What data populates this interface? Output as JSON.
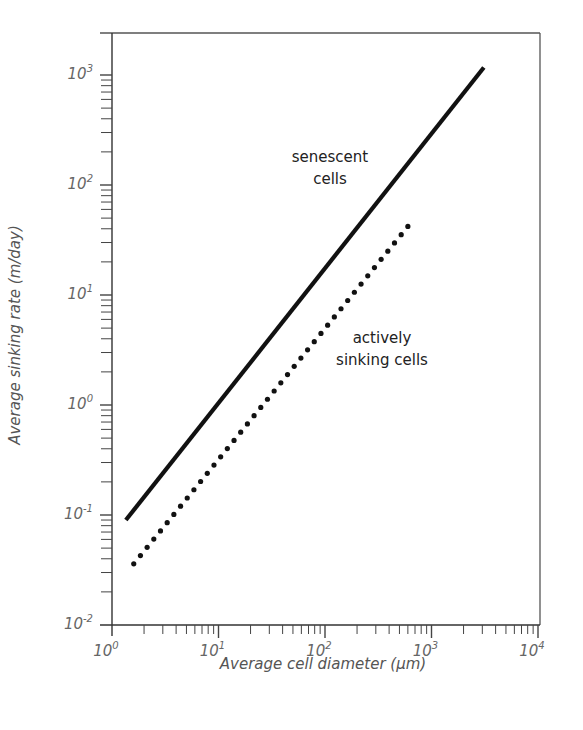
{
  "chart_data": {
    "type": "line",
    "title": "",
    "xlabel": "Average cell diameter (µm)",
    "ylabel": "Average sinking rate (m/day)",
    "xscale": "log",
    "yscale": "log",
    "xlim": [
      1,
      10000
    ],
    "ylim": [
      0.01,
      2000
    ],
    "x_ticks": [
      "10^0",
      "10^1",
      "10^2",
      "10^3",
      "10^4"
    ],
    "y_ticks": [
      "10^-2",
      "10^-1",
      "10^0",
      "10^1",
      "10^2",
      "10^3"
    ],
    "grid": false,
    "legend": "none (inline annotations)",
    "series": [
      {
        "name": "senescent cells",
        "style": "solid",
        "x": [
          1.35,
          3100
        ],
        "y": [
          0.09,
          1170
        ]
      },
      {
        "name": "actively sinking cells",
        "style": "dotted",
        "x": [
          1.6,
          600
        ],
        "y": [
          0.036,
          42
        ]
      }
    ],
    "annotations": [
      {
        "text_lines": [
          "senescent",
          "cells"
        ],
        "near_series": "senescent cells"
      },
      {
        "text_lines": [
          "actively",
          "sinking cells"
        ],
        "near_series": "actively sinking cells"
      }
    ]
  },
  "labels": {
    "x_axis_title": "Average cell diameter (µm)",
    "y_axis_title": "Average sinking rate (m/day)",
    "x_tick_base": [
      "10",
      "10",
      "10",
      "10",
      "10"
    ],
    "x_tick_exp": [
      "0",
      "1",
      "2",
      "3",
      "4"
    ],
    "y_tick_base": [
      "10",
      "10",
      "10",
      "10",
      "10",
      "10"
    ],
    "y_tick_exp": [
      "-2",
      "-1",
      "0",
      "1",
      "2",
      "3"
    ],
    "annot_senescent_1": "senescent",
    "annot_senescent_2": "cells",
    "annot_active_1": "actively",
    "annot_active_2": "sinking cells"
  }
}
